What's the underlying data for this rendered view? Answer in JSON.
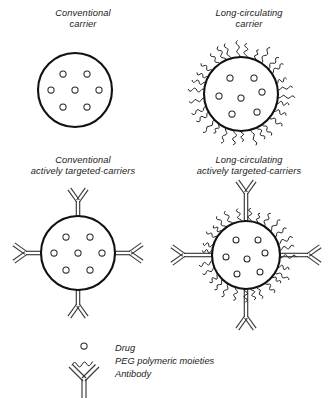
{
  "figure": {
    "background_color": "#ffffff",
    "line_color": "#111111",
    "accent_color": "#3a3a3a"
  },
  "panels": [
    {
      "id": "conventional-carrier",
      "label_line1": "Conventional",
      "label_line2": "carrier",
      "has_peg": false,
      "has_antibody": false,
      "drug_count": 7
    },
    {
      "id": "long-circulating-carrier",
      "label_line1": "Long-circulating",
      "label_line2": "carrier",
      "has_peg": true,
      "has_antibody": false,
      "drug_count": 7
    },
    {
      "id": "conventional-actively-targeted-carriers",
      "label_line1": "Conventional",
      "label_line2": "actively targeted-carriers",
      "has_peg": false,
      "has_antibody": true,
      "antibody_count": 4,
      "drug_count": 7
    },
    {
      "id": "long-circulating-actively-targeted-carriers",
      "label_line1": "Long-circulating",
      "label_line2": "actively targeted-carriers",
      "has_peg": true,
      "has_antibody": true,
      "antibody_count": 4,
      "drug_count": 7
    }
  ],
  "legend": {
    "items": [
      {
        "symbol": "small-open-circle",
        "label": "Drug"
      },
      {
        "symbol": "wavy-line",
        "label": "PEG polymeric moieties"
      },
      {
        "symbol": "y-shape",
        "label": "Antibody"
      }
    ]
  }
}
